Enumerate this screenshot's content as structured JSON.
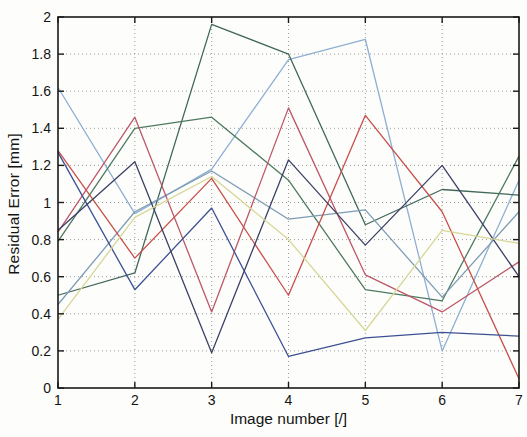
{
  "chart_data": {
    "type": "line",
    "title": "",
    "xlabel": "Image number [/]",
    "ylabel": "Residual Error [mm]",
    "x": [
      1,
      2,
      3,
      4,
      5,
      6,
      7
    ],
    "xlim": [
      1,
      7
    ],
    "ylim": [
      0,
      2
    ],
    "x_ticks": [
      "1",
      "2",
      "3",
      "4",
      "5",
      "6",
      "7"
    ],
    "y_ticks": [
      "0",
      "0.2",
      "0.4",
      "0.6",
      "0.8",
      "1",
      "1.2",
      "1.4",
      "1.6",
      "1.8",
      "2"
    ],
    "grid": "dotted",
    "legend_position": "none",
    "axis_color": "#1a1a1a",
    "grid_color": "#9a9a9a",
    "background": "#fdfdfb",
    "series": [
      {
        "name": "series-1-light-blue",
        "color": "#8fafd2",
        "values": [
          1.62,
          0.94,
          1.18,
          1.77,
          1.88,
          0.2,
          1.12
        ]
      },
      {
        "name": "series-2-dark-green",
        "color": "#41685a",
        "values": [
          0.5,
          0.62,
          1.96,
          1.8,
          0.88,
          1.07,
          1.04
        ]
      },
      {
        "name": "series-3-forest-green",
        "color": "#4e7a60",
        "values": [
          0.79,
          1.4,
          1.46,
          1.12,
          0.53,
          0.47,
          1.25
        ]
      },
      {
        "name": "series-4-gray-blue",
        "color": "#7d9cb4",
        "values": [
          0.45,
          0.95,
          1.17,
          0.91,
          0.96,
          0.49,
          0.95
        ]
      },
      {
        "name": "series-5-red",
        "color": "#c8504b",
        "values": [
          1.28,
          0.7,
          1.13,
          0.5,
          1.47,
          0.95,
          0.05
        ]
      },
      {
        "name": "series-6-rose-red",
        "color": "#bd5868",
        "values": [
          0.84,
          1.46,
          0.41,
          1.51,
          0.61,
          0.41,
          0.68
        ]
      },
      {
        "name": "series-7-blue",
        "color": "#3e5094",
        "values": [
          1.27,
          0.53,
          0.97,
          0.17,
          0.27,
          0.3,
          0.28
        ]
      },
      {
        "name": "series-8-dark-navy",
        "color": "#3c4066",
        "values": [
          0.85,
          1.22,
          0.19,
          1.23,
          0.77,
          1.2,
          0.6
        ]
      },
      {
        "name": "series-9-yellow",
        "color": "#d6d796",
        "values": [
          0.37,
          0.92,
          1.14,
          0.8,
          0.31,
          0.85,
          0.78
        ]
      }
    ],
    "plot_area": {
      "left": 58,
      "right": 519,
      "top": 17,
      "bottom": 388
    },
    "tick_length": 6,
    "tick_font_size": 14,
    "line_width": 1.3
  }
}
